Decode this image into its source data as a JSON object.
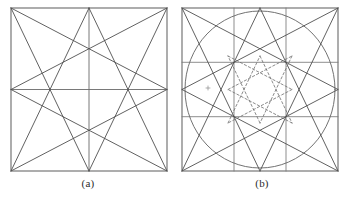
{
  "figure": {
    "kind": "line-drawing",
    "background": "#ffffff",
    "ink": "#4a4a4a",
    "ink_light": "#6f6f6f",
    "panels": [
      {
        "id": "a",
        "caption": "(a)",
        "box": {
          "x": 11,
          "y": 8,
          "w": 156,
          "h": 163
        },
        "elements": [
          "outer-square",
          "horizontal-midline",
          "vertical-midline",
          "octagram-8-3"
        ],
        "dashed": false,
        "circle": false,
        "grid": false
      },
      {
        "id": "b",
        "caption": "(b)",
        "box": {
          "x": 182,
          "y": 8,
          "w": 156,
          "h": 163
        },
        "elements": [
          "outer-square",
          "third-grid",
          "inscribed-circle",
          "octagram-8-3",
          "inner-dashed-octagram",
          "center-mark"
        ],
        "dashed": true,
        "circle": true,
        "grid": true,
        "grid_divisions": 3,
        "inner_scale": 0.41
      }
    ],
    "geometry": {
      "star_type": "octagram",
      "schlafli": "{8/3}",
      "vertex_count": 8,
      "vertex_sources": [
        "corner-tl",
        "mid-top",
        "corner-tr",
        "mid-right",
        "corner-br",
        "mid-bottom",
        "corner-bl",
        "mid-left"
      ],
      "step": 3
    }
  }
}
